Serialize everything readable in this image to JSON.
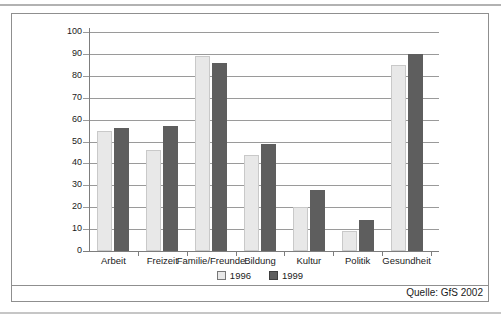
{
  "figure": {
    "source_label": "Quelle: GfS 2002"
  },
  "chart_data": {
    "type": "bar",
    "title": "",
    "xlabel": "",
    "ylabel": "",
    "categories": [
      "Arbeit",
      "Freizeit",
      "Familie/Freunde",
      "Bildung",
      "Kultur",
      "Politik",
      "Gesundheit"
    ],
    "series": [
      {
        "name": "1996",
        "color": "#e8e8e8",
        "border": "#c9c9c9",
        "swatch_border": "#777777",
        "values": [
          55,
          46,
          89,
          44,
          20,
          9,
          85
        ]
      },
      {
        "name": "1999",
        "color": "#5e5e5e",
        "border": "#5e5e5e",
        "swatch_border": "#3f3f3f",
        "values": [
          56,
          57,
          86,
          49,
          28,
          14,
          90
        ]
      }
    ],
    "ylim": [
      0,
      100
    ],
    "ytick_step": 10,
    "grid": true,
    "legend_position": "bottom-center"
  }
}
